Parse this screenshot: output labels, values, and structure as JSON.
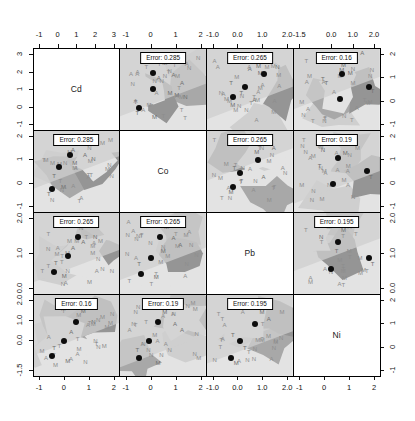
{
  "chart_data": {
    "type": "scatter",
    "title": "",
    "subtitle": "",
    "xlabel": "",
    "ylabel": "",
    "grid": false,
    "legend": false,
    "variables": [
      "Cd",
      "Co",
      "Pb",
      "Ni"
    ],
    "panel_count": 16,
    "diagonal_labels": [
      "Cd",
      "Co",
      "Pb",
      "Ni"
    ],
    "error_label_prefix": "Error:",
    "error_matrix": [
      [
        null,
        0.285,
        0.265,
        0.16
      ],
      [
        0.285,
        null,
        0.265,
        0.19
      ],
      [
        0.265,
        0.265,
        null,
        0.195
      ],
      [
        0.16,
        0.19,
        0.195,
        null
      ]
    ],
    "error_labels": [
      [
        "",
        "Error: 0.285",
        "Error: 0.265",
        "Error: 0.16"
      ],
      [
        "Error: 0.285",
        "",
        "Error: 0.265",
        "Error: 0.19"
      ],
      [
        "Error: 0.265",
        "Error: 0.265",
        "",
        "Error: 0.195"
      ],
      [
        "Error: 0.16",
        "Error: 0.19",
        "Error: 0.195",
        ""
      ]
    ],
    "axes": {
      "top": [
        {
          "column": 1,
          "variable": "Cd",
          "ticks": [
            -1,
            0,
            1,
            2,
            3
          ],
          "labels": [
            "-1",
            "0",
            "1",
            "2",
            "3"
          ]
        },
        {
          "column": 2,
          "variable": "Co",
          "ticks": [
            -1,
            0,
            1,
            2
          ],
          "labels": [
            "-1",
            "0",
            "1",
            "2"
          ]
        },
        {
          "column": 3,
          "variable": "Pb",
          "ticks": [
            -1.0,
            0.0,
            1.0,
            2.0
          ],
          "labels": [
            "-1.0",
            "0.0",
            "1.0",
            "2.0"
          ]
        },
        {
          "column": 4,
          "variable": "Ni",
          "ticks": [
            -1.5,
            0.0,
            1.0,
            2.0
          ],
          "labels": [
            "-1.5",
            "0.0",
            "1.0",
            "2.0"
          ]
        }
      ],
      "bottom": [
        {
          "column": 1,
          "variable": "Cd",
          "ticks": [
            -1,
            0,
            1,
            2
          ],
          "labels": [
            "-1",
            "0",
            "1",
            "2"
          ]
        },
        {
          "column": 2,
          "variable": "Co",
          "ticks": [
            -1,
            0,
            1,
            2
          ],
          "labels": [
            "-1",
            "0",
            "1",
            "2"
          ]
        },
        {
          "column": 3,
          "variable": "Pb",
          "ticks": [
            -1.0,
            0.0,
            1.0,
            2.0
          ],
          "labels": [
            "-1.0",
            "0.0",
            "1.0",
            "2.0"
          ]
        },
        {
          "column": 4,
          "variable": "Ni",
          "ticks": [
            -1,
            0,
            1,
            2
          ],
          "labels": [
            "-1",
            "0",
            "1",
            "2"
          ]
        }
      ],
      "left": [
        {
          "row": 1,
          "variable": "Cd",
          "ticks": [
            -1,
            0,
            1,
            2,
            3
          ],
          "labels": [
            "-1",
            "0",
            "1",
            "2",
            "3"
          ]
        },
        {
          "row": 2,
          "variable": "Co",
          "ticks": [
            -1,
            0,
            1,
            2
          ],
          "labels": [
            "-1",
            "0",
            "1",
            "2"
          ]
        },
        {
          "row": 3,
          "variable": "Pb",
          "ticks": [
            0.0,
            1.0,
            2.0
          ],
          "labels": [
            "0.0",
            "1.0",
            "2.0"
          ]
        },
        {
          "row": 4,
          "variable": "Ni",
          "ticks": [
            -1.5,
            0.0,
            1.0,
            2.0
          ],
          "labels": [
            "-1.5",
            "0.0",
            "1.0",
            "2.0"
          ]
        }
      ],
      "right": [
        {
          "row": 1,
          "variable": "Cd",
          "ticks": [
            -1,
            0,
            1,
            2
          ],
          "labels": [
            "-1",
            "0",
            "1",
            "2"
          ]
        },
        {
          "row": 2,
          "variable": "Co",
          "ticks": [
            -1,
            0,
            1,
            2
          ],
          "labels": [
            "-1",
            "0",
            "1",
            "2"
          ]
        },
        {
          "row": 3,
          "variable": "Pb",
          "ticks": [
            0.0,
            1.0,
            2.0
          ],
          "labels": [
            "0.0",
            "1.0",
            "2.0"
          ]
        },
        {
          "row": 4,
          "variable": "Ni",
          "ticks": [
            -1,
            0,
            1,
            2
          ],
          "labels": [
            "-1",
            "0",
            "1",
            "2"
          ]
        }
      ]
    },
    "class_symbols": [
      "M",
      "A",
      "T",
      "N"
    ],
    "colors": {
      "point": "#0d0d0d",
      "region_light": "#e3e3e3",
      "region_mid": "#cfcfcf",
      "region_dark": "#a8a8a8",
      "region_darker": "#959595",
      "text": "#111111",
      "symbol": "#6f6f6f",
      "panel_border": "#000000",
      "background": "#ffffff"
    },
    "panels": [
      {
        "row": 1,
        "col": 2,
        "xvar": "Co",
        "yvar": "Cd",
        "error": "Error: 0.285",
        "points": [
          [
            0.38,
            0.3
          ],
          [
            0.38,
            0.5
          ],
          [
            0.22,
            0.74
          ]
        ],
        "symbols": [
          [
            "M",
            0.52,
            0.18
          ],
          [
            "A",
            0.45,
            0.36
          ],
          [
            "A",
            0.62,
            0.33
          ],
          [
            "A",
            0.72,
            0.42
          ],
          [
            "M",
            0.58,
            0.55
          ],
          [
            "M",
            0.66,
            0.57
          ],
          [
            "N",
            0.76,
            0.6
          ],
          [
            "T",
            0.18,
            0.66
          ],
          [
            "M",
            0.4,
            0.85
          ],
          [
            "T",
            0.2,
            0.8
          ]
        ]
      },
      {
        "row": 1,
        "col": 3,
        "xvar": "Pb",
        "yvar": "Cd",
        "error": "Error: 0.265",
        "points": [
          [
            0.66,
            0.31
          ],
          [
            0.44,
            0.48
          ],
          [
            0.3,
            0.6
          ]
        ],
        "symbols": [
          [
            "M",
            0.74,
            0.08
          ],
          [
            "A",
            0.5,
            0.25
          ],
          [
            "M",
            0.6,
            0.22
          ],
          [
            "M",
            0.62,
            0.3
          ],
          [
            "N",
            0.82,
            0.23
          ],
          [
            "T",
            0.28,
            0.42
          ],
          [
            "T",
            0.4,
            0.55
          ],
          [
            "M",
            0.3,
            0.7
          ],
          [
            "A",
            0.55,
            0.64
          ]
        ]
      },
      {
        "row": 1,
        "col": 4,
        "xvar": "Ni",
        "yvar": "Cd",
        "error": "Error: 0.16",
        "points": [
          [
            0.56,
            0.32
          ],
          [
            0.88,
            0.47
          ],
          [
            0.54,
            0.62
          ]
        ],
        "symbols": [
          [
            "A",
            0.8,
            0.06
          ],
          [
            "M",
            0.58,
            0.2
          ],
          [
            "M",
            0.56,
            0.27
          ],
          [
            "N",
            0.4,
            0.15
          ],
          [
            "T",
            0.34,
            0.38
          ],
          [
            "T",
            0.38,
            0.43
          ],
          [
            "T",
            0.92,
            0.52
          ],
          [
            "M",
            0.66,
            0.3
          ]
        ]
      },
      {
        "row": 2,
        "col": 1,
        "xvar": "Cd",
        "yvar": "Co",
        "error": "Error: 0.285",
        "points": [
          [
            0.42,
            0.3
          ],
          [
            0.3,
            0.45
          ],
          [
            0.22,
            0.72
          ]
        ],
        "symbols": [
          [
            "M",
            0.55,
            0.12
          ],
          [
            "A",
            0.46,
            0.24
          ],
          [
            "A",
            0.6,
            0.3
          ],
          [
            "M",
            0.48,
            0.4
          ],
          [
            "T",
            0.24,
            0.56
          ],
          [
            "M",
            0.35,
            0.7
          ],
          [
            "N",
            0.7,
            0.35
          ],
          [
            "T",
            0.18,
            0.78
          ]
        ]
      },
      {
        "row": 2,
        "col": 3,
        "xvar": "Pb",
        "yvar": "Co",
        "error": "Error: 0.265",
        "points": [
          [
            0.6,
            0.36
          ],
          [
            0.38,
            0.52
          ],
          [
            0.3,
            0.7
          ]
        ],
        "symbols": [
          [
            "M",
            0.7,
            0.14
          ],
          [
            "A",
            0.78,
            0.22
          ],
          [
            "M",
            0.58,
            0.26
          ],
          [
            "T",
            0.32,
            0.46
          ],
          [
            "T",
            0.4,
            0.62
          ],
          [
            "M",
            0.28,
            0.76
          ],
          [
            "A",
            0.66,
            0.58
          ]
        ]
      },
      {
        "row": 2,
        "col": 4,
        "xvar": "Ni",
        "yvar": "Co",
        "error": "Error: 0.19",
        "points": [
          [
            0.52,
            0.34
          ],
          [
            0.86,
            0.5
          ],
          [
            0.46,
            0.66
          ]
        ],
        "symbols": [
          [
            "M",
            0.56,
            0.16
          ],
          [
            "A",
            0.72,
            0.1
          ],
          [
            "N",
            0.34,
            0.24
          ],
          [
            "T",
            0.3,
            0.44
          ],
          [
            "T",
            0.9,
            0.58
          ],
          [
            "M",
            0.6,
            0.28
          ]
        ]
      },
      {
        "row": 3,
        "col": 1,
        "xvar": "Cd",
        "yvar": "Pb",
        "error": "Error: 0.265",
        "points": [
          [
            0.52,
            0.3
          ],
          [
            0.4,
            0.54
          ],
          [
            0.24,
            0.74
          ]
        ],
        "symbols": [
          [
            "M",
            0.6,
            0.14
          ],
          [
            "A",
            0.46,
            0.44
          ],
          [
            "A",
            0.58,
            0.36
          ],
          [
            "T",
            0.26,
            0.62
          ],
          [
            "M",
            0.36,
            0.78
          ],
          [
            "N",
            0.72,
            0.3
          ]
        ]
      },
      {
        "row": 3,
        "col": 2,
        "xvar": "Co",
        "yvar": "Pb",
        "error": "Error: 0.265",
        "points": [
          [
            0.46,
            0.3
          ],
          [
            0.36,
            0.56
          ],
          [
            0.24,
            0.76
          ]
        ],
        "symbols": [
          [
            "M",
            0.54,
            0.18
          ],
          [
            "A",
            0.62,
            0.32
          ],
          [
            "A",
            0.7,
            0.4
          ],
          [
            "T",
            0.22,
            0.64
          ],
          [
            "M",
            0.42,
            0.8
          ],
          [
            "M",
            0.5,
            0.48
          ]
        ]
      },
      {
        "row": 3,
        "col": 4,
        "xvar": "Ni",
        "yvar": "Pb",
        "error": "Error: 0.195",
        "points": [
          [
            0.52,
            0.36
          ],
          [
            0.88,
            0.56
          ],
          [
            0.44,
            0.7
          ]
        ],
        "symbols": [
          [
            "T",
            0.5,
            0.48
          ],
          [
            "M",
            0.58,
            0.22
          ],
          [
            "N",
            0.32,
            0.3
          ],
          [
            "T",
            0.92,
            0.64
          ],
          [
            "A",
            0.74,
            0.16
          ]
        ]
      },
      {
        "row": 4,
        "col": 1,
        "xvar": "Cd",
        "yvar": "Ni",
        "error": "Error: 0.16",
        "points": [
          [
            0.5,
            0.34
          ],
          [
            0.36,
            0.58
          ],
          [
            0.22,
            0.76
          ]
        ],
        "symbols": [
          [
            "M",
            0.58,
            0.2
          ],
          [
            "A",
            0.44,
            0.46
          ],
          [
            "T",
            0.24,
            0.66
          ],
          [
            "M",
            0.4,
            0.82
          ],
          [
            "N",
            0.7,
            0.34
          ]
        ]
      },
      {
        "row": 4,
        "col": 2,
        "xvar": "Co",
        "yvar": "Ni",
        "error": "Error: 0.19",
        "points": [
          [
            0.44,
            0.34
          ],
          [
            0.34,
            0.58
          ],
          [
            0.22,
            0.78
          ]
        ],
        "symbols": [
          [
            "M",
            0.52,
            0.22
          ],
          [
            "A",
            0.64,
            0.36
          ],
          [
            "T",
            0.2,
            0.68
          ],
          [
            "M",
            0.44,
            0.84
          ],
          [
            "A",
            0.72,
            0.44
          ]
        ]
      },
      {
        "row": 4,
        "col": 3,
        "xvar": "Pb",
        "yvar": "Ni",
        "error": "Error: 0.195",
        "points": [
          [
            0.56,
            0.36
          ],
          [
            0.38,
            0.58
          ],
          [
            0.28,
            0.78
          ]
        ],
        "symbols": [
          [
            "M",
            0.64,
            0.22
          ],
          [
            "T",
            0.3,
            0.5
          ],
          [
            "A",
            0.72,
            0.3
          ],
          [
            "M",
            0.34,
            0.84
          ],
          [
            "T",
            0.44,
            0.66
          ]
        ]
      }
    ]
  }
}
